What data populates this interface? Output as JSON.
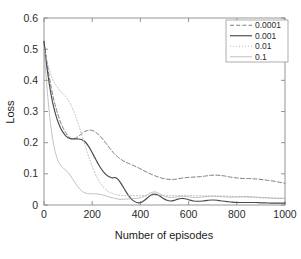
{
  "figure": {
    "background_color": "#ffffff",
    "plot_area": {
      "left": 44,
      "top": 18,
      "right": 285,
      "bottom": 205
    }
  },
  "axes": {
    "y_label": "Loss",
    "x_label": "Number of episodes",
    "y_ticks": [
      "0",
      "0.1",
      "0.2",
      "0.3",
      "0.4",
      "0.5",
      "0.6"
    ],
    "x_ticks": [
      "0",
      "200",
      "400",
      "600",
      "800",
      "1000"
    ],
    "axis_color": "#8a8a8a",
    "text_color": "#2b2b2b"
  },
  "legend": {
    "position": "top-right",
    "border_color": "#9a9a9a",
    "entries": [
      {
        "label": "0.0001",
        "style": "dashed",
        "color": "#6f6f6f",
        "width": 0.9
      },
      {
        "label": "0.001",
        "style": "solid",
        "color": "#4a4a4a",
        "width": 1.15
      },
      {
        "label": "0.01",
        "style": "dotted",
        "color": "#b4b4b4",
        "width": 0.9
      },
      {
        "label": "0.1",
        "style": "solid",
        "color": "#a8a8a8",
        "width": 0.7
      }
    ]
  },
  "chart_data": {
    "type": "line",
    "title": "",
    "xlabel": "Number of episodes",
    "ylabel": "Loss",
    "xlim": [
      0,
      1000
    ],
    "ylim": [
      0,
      0.6
    ],
    "xticks": [
      0,
      200,
      400,
      600,
      800,
      1000
    ],
    "yticks": [
      0,
      0.1,
      0.2,
      0.3,
      0.4,
      0.5,
      0.6
    ],
    "grid": false,
    "legend_position": "upper right",
    "legend_title": "",
    "series": [
      {
        "name": "0.0001",
        "style": "dashed",
        "color": "#6f6f6f",
        "x": [
          0,
          10,
          20,
          30,
          40,
          50,
          60,
          70,
          80,
          90,
          100,
          110,
          120,
          130,
          140,
          150,
          160,
          170,
          180,
          190,
          200,
          215,
          230,
          245,
          260,
          275,
          290,
          305,
          320,
          335,
          350,
          370,
          390,
          410,
          430,
          450,
          470,
          490,
          510,
          530,
          550,
          570,
          590,
          610,
          630,
          650,
          670,
          690,
          710,
          730,
          750,
          770,
          790,
          810,
          830,
          850,
          870,
          890,
          910,
          930,
          950,
          970,
          990,
          1000
        ],
        "y": [
          0.525,
          0.47,
          0.42,
          0.378,
          0.34,
          0.31,
          0.285,
          0.263,
          0.246,
          0.232,
          0.222,
          0.214,
          0.212,
          0.214,
          0.219,
          0.225,
          0.231,
          0.236,
          0.239,
          0.24,
          0.239,
          0.233,
          0.223,
          0.21,
          0.195,
          0.18,
          0.166,
          0.155,
          0.146,
          0.139,
          0.134,
          0.127,
          0.12,
          0.112,
          0.104,
          0.097,
          0.091,
          0.086,
          0.083,
          0.082,
          0.083,
          0.086,
          0.088,
          0.089,
          0.09,
          0.091,
          0.093,
          0.095,
          0.096,
          0.095,
          0.093,
          0.09,
          0.088,
          0.086,
          0.085,
          0.085,
          0.084,
          0.083,
          0.081,
          0.079,
          0.077,
          0.074,
          0.071,
          0.07
        ]
      },
      {
        "name": "0.001",
        "style": "solid",
        "color": "#4a4a4a",
        "x": [
          0,
          10,
          20,
          30,
          40,
          50,
          60,
          70,
          80,
          90,
          100,
          110,
          125,
          140,
          155,
          170,
          185,
          200,
          215,
          230,
          245,
          260,
          275,
          285,
          295,
          310,
          325,
          340,
          355,
          370,
          385,
          395,
          405,
          420,
          435,
          450,
          465,
          480,
          495,
          510,
          525,
          540,
          555,
          570,
          585,
          600,
          620,
          640,
          660,
          680,
          700,
          720,
          740,
          760,
          780,
          800,
          820,
          840,
          860,
          880,
          900,
          920,
          940,
          960,
          980,
          1000
        ],
        "y": [
          0.525,
          0.455,
          0.398,
          0.352,
          0.315,
          0.286,
          0.263,
          0.245,
          0.232,
          0.222,
          0.216,
          0.213,
          0.212,
          0.212,
          0.21,
          0.203,
          0.188,
          0.168,
          0.146,
          0.125,
          0.108,
          0.096,
          0.089,
          0.087,
          0.088,
          0.08,
          0.062,
          0.043,
          0.026,
          0.014,
          0.008,
          0.007,
          0.009,
          0.017,
          0.027,
          0.034,
          0.034,
          0.029,
          0.021,
          0.015,
          0.013,
          0.015,
          0.019,
          0.021,
          0.02,
          0.017,
          0.013,
          0.012,
          0.013,
          0.015,
          0.016,
          0.015,
          0.013,
          0.011,
          0.009,
          0.008,
          0.008,
          0.008,
          0.008,
          0.008,
          0.007,
          0.007,
          0.006,
          0.006,
          0.006,
          0.006
        ]
      },
      {
        "name": "0.01",
        "style": "dotted",
        "color": "#b4b4b4",
        "x": [
          0,
          10,
          20,
          30,
          40,
          50,
          60,
          70,
          80,
          90,
          100,
          115,
          130,
          145,
          160,
          175,
          190,
          205,
          220,
          235,
          250,
          265,
          280,
          300,
          320,
          340,
          360,
          380,
          400,
          425,
          450,
          475,
          500,
          525,
          550,
          575,
          600,
          625,
          650,
          675,
          700,
          725,
          750,
          775,
          800,
          825,
          850,
          875,
          900,
          925,
          950,
          975,
          1000
        ],
        "y": [
          0.505,
          0.47,
          0.44,
          0.416,
          0.398,
          0.384,
          0.373,
          0.364,
          0.356,
          0.348,
          0.338,
          0.316,
          0.288,
          0.254,
          0.217,
          0.18,
          0.145,
          0.114,
          0.088,
          0.068,
          0.054,
          0.044,
          0.038,
          0.033,
          0.031,
          0.03,
          0.03,
          0.03,
          0.03,
          0.03,
          0.031,
          0.031,
          0.03,
          0.03,
          0.03,
          0.031,
          0.031,
          0.03,
          0.029,
          0.029,
          0.029,
          0.029,
          0.029,
          0.028,
          0.027,
          0.026,
          0.025,
          0.024,
          0.023,
          0.023,
          0.022,
          0.022,
          0.022
        ]
      },
      {
        "name": "0.1",
        "style": "solid",
        "color": "#a8a8a8",
        "x": [
          0,
          8,
          16,
          24,
          32,
          40,
          48,
          56,
          64,
          72,
          80,
          90,
          100,
          110,
          120,
          130,
          140,
          150,
          160,
          170,
          180,
          195,
          210,
          225,
          240,
          255,
          270,
          285,
          300,
          320,
          340,
          360,
          380,
          400,
          420,
          440,
          455,
          470,
          490,
          510,
          530,
          550,
          570,
          590,
          610,
          630,
          650,
          670,
          690,
          710,
          730,
          750,
          770,
          790,
          810,
          830,
          850,
          870,
          890,
          910,
          930,
          950,
          975,
          1000
        ],
        "y": [
          0.5,
          0.42,
          0.345,
          0.282,
          0.232,
          0.194,
          0.166,
          0.146,
          0.133,
          0.124,
          0.118,
          0.112,
          0.104,
          0.094,
          0.082,
          0.07,
          0.059,
          0.05,
          0.043,
          0.039,
          0.037,
          0.036,
          0.036,
          0.035,
          0.033,
          0.03,
          0.026,
          0.023,
          0.02,
          0.018,
          0.019,
          0.02,
          0.021,
          0.023,
          0.029,
          0.038,
          0.042,
          0.04,
          0.032,
          0.026,
          0.024,
          0.026,
          0.028,
          0.027,
          0.025,
          0.024,
          0.025,
          0.027,
          0.028,
          0.028,
          0.027,
          0.026,
          0.025,
          0.025,
          0.026,
          0.027,
          0.027,
          0.026,
          0.025,
          0.024,
          0.023,
          0.022,
          0.021,
          0.021
        ]
      }
    ]
  }
}
